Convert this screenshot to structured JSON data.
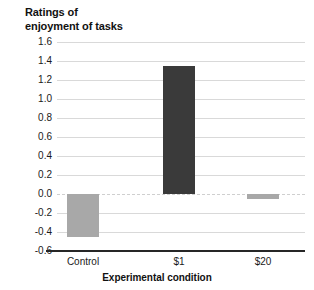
{
  "chart_data": {
    "type": "bar",
    "title": "Ratings of\nenjoyment of tasks",
    "xlabel": "Experimental condition",
    "ylabel": "",
    "categories": [
      "Control",
      "$1",
      "$20"
    ],
    "values": [
      -0.45,
      1.35,
      -0.05
    ],
    "ylim": [
      -0.6,
      1.6
    ],
    "ytick_step": 0.2,
    "ytick_labels": [
      "1.6",
      "1.4",
      "1.2",
      "1.0",
      "0.8",
      "0.6",
      "0.4",
      "0.2",
      "0.0",
      "-0.2",
      "-0.4",
      "-0.6"
    ],
    "ytick_values": [
      1.6,
      1.4,
      1.2,
      1.0,
      0.8,
      0.6,
      0.4,
      0.2,
      0.0,
      -0.2,
      -0.4,
      -0.6
    ],
    "grid": true,
    "legend": false,
    "bar_colors": [
      "#a8a8a8",
      "#3a3a3a",
      "#a8a8a8"
    ],
    "zero_line_color": "#cfcfcf",
    "gridline_color": "#d9d9d9",
    "axis_color": "#262626"
  }
}
